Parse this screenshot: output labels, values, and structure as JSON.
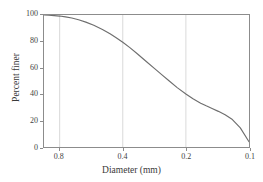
{
  "chart_data": {
    "type": "line",
    "title": "",
    "xlabel": "Diameter (mm)",
    "ylabel": "Percent finer",
    "xscale": "log",
    "x_reversed": true,
    "xlim": [
      0.95,
      0.1
    ],
    "ylim": [
      0,
      100
    ],
    "grid": "vertical-only",
    "legend": null,
    "xticks": [
      "0.8",
      "0.4",
      "0.2",
      "0.1"
    ],
    "xtick_values": [
      0.8,
      0.4,
      0.2,
      0.1
    ],
    "yticks": [
      "0",
      "20",
      "40",
      "60",
      "80",
      "100"
    ],
    "ytick_values": [
      0,
      20,
      40,
      60,
      80,
      100
    ],
    "series": [
      {
        "name": "Grain size distribution",
        "color": "#6e6e6e",
        "x": [
          0.95,
          0.9,
          0.85,
          0.8,
          0.75,
          0.7,
          0.65,
          0.6,
          0.55,
          0.5,
          0.46,
          0.43,
          0.4,
          0.37,
          0.34,
          0.31,
          0.28,
          0.26,
          0.24,
          0.22,
          0.2,
          0.185,
          0.17,
          0.16,
          0.15,
          0.14,
          0.13,
          0.12,
          0.11,
          0.1
        ],
        "y": [
          100,
          99.8,
          99.5,
          99.2,
          98.6,
          97.7,
          96.4,
          94.6,
          92.2,
          89.0,
          85.8,
          82.8,
          79.4,
          75.3,
          70.5,
          65.0,
          59.0,
          54.6,
          50.0,
          45.0,
          40.2,
          36.5,
          33.2,
          31.2,
          29.2,
          27.0,
          24.4,
          20.8,
          14.5,
          4.0
        ]
      }
    ]
  },
  "axes": {
    "x_title": "Diameter (mm)",
    "y_title": "Percent finer"
  },
  "colors": {
    "curve": "#6e6e6e",
    "frame": "#8c8c8c",
    "gridline": "#cfcfcf",
    "text": "#3a3a3a",
    "background": "#ffffff"
  }
}
